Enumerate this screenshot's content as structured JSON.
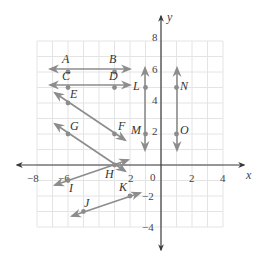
{
  "diagram": {
    "type": "coordinate-plane",
    "x_axis_label": "x",
    "y_axis_label": "y",
    "origin_label": "0",
    "x_range": [
      -8,
      4
    ],
    "y_range": [
      -4,
      8
    ],
    "grid_step": 1,
    "x_ticks": [
      {
        "value": -8,
        "label": "−8"
      },
      {
        "value": -6,
        "label": "−6"
      },
      {
        "value": -2,
        "label": "2"
      },
      {
        "value": 2,
        "label": "2"
      },
      {
        "value": 4,
        "label": "4"
      }
    ],
    "y_ticks": [
      {
        "value": 8,
        "label": "8"
      },
      {
        "value": 6,
        "label": "6"
      },
      {
        "value": 4,
        "label": "4"
      },
      {
        "value": 2,
        "label": "2"
      },
      {
        "value": -2,
        "label": "−2"
      },
      {
        "value": -4,
        "label": "−4"
      }
    ],
    "points": [
      {
        "name": "A",
        "x": -6,
        "y": 6
      },
      {
        "name": "B",
        "x": -3,
        "y": 6
      },
      {
        "name": "C",
        "x": -6,
        "y": 5
      },
      {
        "name": "D",
        "x": -3,
        "y": 5
      },
      {
        "name": "E",
        "x": -6,
        "y": 4
      },
      {
        "name": "F",
        "x": -3,
        "y": 2
      },
      {
        "name": "G",
        "x": -6,
        "y": 2
      },
      {
        "name": "H",
        "x": -3,
        "y": 0
      },
      {
        "name": "I",
        "x": -6,
        "y": -1
      },
      {
        "name": "J",
        "x": -5,
        "y": -3
      },
      {
        "name": "K",
        "x": -2,
        "y": -2
      },
      {
        "name": "L",
        "x": -1,
        "y": 5
      },
      {
        "name": "M",
        "x": -1,
        "y": 2
      },
      {
        "name": "N",
        "x": 1,
        "y": 5
      },
      {
        "name": "O",
        "x": 1,
        "y": 2
      }
    ],
    "lines": [
      {
        "name": "line-AB",
        "through": [
          "A",
          "B"
        ]
      },
      {
        "name": "line-CD",
        "through": [
          "C",
          "D"
        ]
      },
      {
        "name": "line-EF",
        "through": [
          "E",
          "F"
        ]
      },
      {
        "name": "line-GH",
        "through": [
          "G",
          "H"
        ]
      },
      {
        "name": "line-IH",
        "through": [
          "I",
          "H"
        ]
      },
      {
        "name": "line-JK",
        "through": [
          "J",
          "K"
        ]
      },
      {
        "name": "line-LM",
        "through": [
          "L",
          "M"
        ]
      },
      {
        "name": "line-NO",
        "through": [
          "N",
          "O"
        ]
      }
    ],
    "colors": {
      "grid": "#e4e4e4",
      "axis": "#3a3a3a",
      "lines": "#8c8c8c",
      "text": "#333333"
    }
  }
}
